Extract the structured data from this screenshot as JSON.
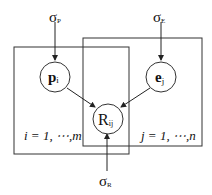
{
  "diagram": {
    "type": "probabilistic graphical model (plate notation)",
    "nodes": {
      "sigma_p": {
        "symbol": "σ",
        "sub": "P"
      },
      "sigma_e": {
        "symbol": "σ",
        "sub": "E"
      },
      "sigma_r": {
        "symbol": "σ",
        "sub": "R"
      },
      "p": {
        "symbol": "p",
        "sub": "i"
      },
      "e": {
        "symbol": "e",
        "sub": "j"
      },
      "r": {
        "symbol": "R",
        "sub": "ij"
      }
    },
    "plates": {
      "left": {
        "label": "i = 1, ⋯,m"
      },
      "right": {
        "label": "j = 1, ⋯,n"
      }
    },
    "edges": [
      {
        "from": "sigma_p",
        "to": "p"
      },
      {
        "from": "sigma_e",
        "to": "e"
      },
      {
        "from": "p",
        "to": "r"
      },
      {
        "from": "e",
        "to": "r"
      },
      {
        "from": "sigma_r",
        "to": "r"
      }
    ]
  }
}
